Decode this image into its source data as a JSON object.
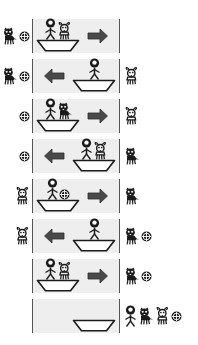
{
  "diagram": {
    "entities": {
      "person": "person-icon",
      "wolf": "wolf-icon",
      "goat": "goat-icon",
      "coin": "coin-icon",
      "boat": "boat-icon",
      "arrow_right": "arrow-right-icon",
      "arrow_left": "arrow-left-icon"
    },
    "colors": {
      "river_fill": "#eeeeee",
      "bank_line": "#555555",
      "ink": "#1a1a1a"
    },
    "step_count": 8,
    "steps": [
      {
        "index": 1,
        "left_bank": [
          "wolf",
          "coin"
        ],
        "boat": [
          "person",
          "goat"
        ],
        "boat_position": "left",
        "direction": "right",
        "right_bank": []
      },
      {
        "index": 2,
        "left_bank": [
          "wolf",
          "coin"
        ],
        "boat": [
          "person"
        ],
        "boat_position": "right",
        "direction": "left",
        "right_bank": [
          "goat"
        ]
      },
      {
        "index": 3,
        "left_bank": [
          "coin"
        ],
        "boat": [
          "person",
          "wolf"
        ],
        "boat_position": "left",
        "direction": "right",
        "right_bank": [
          "goat"
        ]
      },
      {
        "index": 4,
        "left_bank": [
          "coin"
        ],
        "boat": [
          "person",
          "goat"
        ],
        "boat_position": "right",
        "direction": "left",
        "right_bank": [
          "wolf"
        ]
      },
      {
        "index": 5,
        "left_bank": [
          "goat"
        ],
        "boat": [
          "person",
          "coin"
        ],
        "boat_position": "left",
        "direction": "right",
        "right_bank": [
          "wolf"
        ]
      },
      {
        "index": 6,
        "left_bank": [
          "goat"
        ],
        "boat": [
          "person"
        ],
        "boat_position": "right",
        "direction": "left",
        "right_bank": [
          "wolf",
          "coin"
        ]
      },
      {
        "index": 7,
        "left_bank": [],
        "boat": [
          "person",
          "goat"
        ],
        "boat_position": "left",
        "direction": "right",
        "right_bank": [
          "wolf",
          "coin"
        ]
      },
      {
        "index": 8,
        "left_bank": [],
        "boat": [],
        "boat_position": "right",
        "direction": "none",
        "right_bank": [
          "person",
          "wolf",
          "goat",
          "coin"
        ]
      }
    ]
  }
}
